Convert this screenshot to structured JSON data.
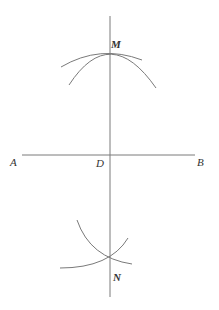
{
  "diagram": {
    "stroke_color": "#7a7a7a",
    "label_color": "#333333",
    "points": {
      "A": {
        "label": "A",
        "x": 22,
        "y": 155
      },
      "B": {
        "label": "B",
        "x": 195,
        "y": 155
      },
      "D": {
        "label": "D",
        "x": 110,
        "y": 155
      },
      "M": {
        "label": "M",
        "x": 110,
        "y": 51
      },
      "N": {
        "label": "N",
        "x": 110,
        "y": 260
      }
    },
    "segments": [
      {
        "name": "segment-AB",
        "from": "A",
        "to": "B"
      },
      {
        "name": "line-MN",
        "x": 110,
        "y1": 16,
        "y2": 297
      }
    ],
    "arcs": [
      {
        "name": "arc-upper-flat",
        "near": "M"
      },
      {
        "name": "arc-upper-steep",
        "near": "M"
      },
      {
        "name": "arc-lower-from-upper-left",
        "near": "N"
      },
      {
        "name": "arc-lower-from-left",
        "near": "N"
      }
    ]
  }
}
